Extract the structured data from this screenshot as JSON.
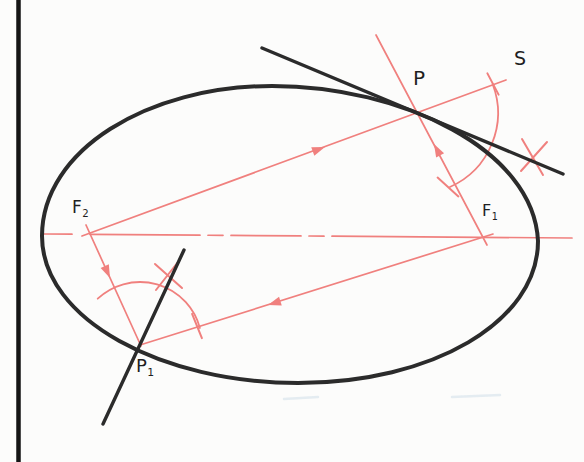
{
  "figure": {
    "colors": {
      "paper": "#fcfcfb",
      "ink": "#2b2b2b",
      "edge": "#151515",
      "red": "#f0807e",
      "smudge": "#b8cfe0"
    },
    "labels": {
      "p": "P",
      "s": "S",
      "f2": {
        "base": "F",
        "sub": "2"
      },
      "f1": {
        "base": "F",
        "sub": "1"
      },
      "p1": {
        "base": "P",
        "sub": "1"
      }
    }
  }
}
